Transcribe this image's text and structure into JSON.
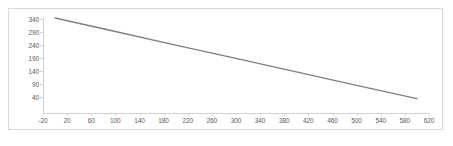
{
  "chart_data": {
    "type": "line",
    "title": "",
    "xlabel": "",
    "ylabel": "",
    "xlim": [
      -20,
      620
    ],
    "ylim": [
      -20,
      345
    ],
    "grid": false,
    "legend": false,
    "legend_position": "none",
    "x_ticks": [
      -20,
      20,
      60,
      100,
      140,
      180,
      220,
      260,
      300,
      340,
      380,
      420,
      460,
      500,
      540,
      580,
      620
    ],
    "x_tick_labels": [
      "-20",
      "20",
      "60",
      "100",
      "140",
      "180",
      "220",
      "260",
      "300",
      "340",
      "380",
      "420",
      "460",
      "500",
      "540",
      "580",
      "620"
    ],
    "y_ticks": [
      40,
      90,
      140,
      190,
      240,
      290,
      340
    ],
    "y_tick_labels": [
      "40",
      "90",
      "140",
      "190",
      "240",
      "290",
      "340"
    ],
    "series": [
      {
        "name": "series-1",
        "color": "#7f7f7f",
        "line_width": 1.4,
        "x": [
          0,
          100,
          200,
          300,
          400,
          500,
          600
        ],
        "values": [
          345,
          293,
          241,
          190,
          138,
          86,
          35
        ]
      }
    ]
  },
  "frame": {
    "border_color": "#d9d9d9",
    "background": "#ffffff"
  },
  "axis": {
    "line_color": "#d0d0d0",
    "tick_color": "#d0d0d0",
    "label_color": "#595959"
  }
}
